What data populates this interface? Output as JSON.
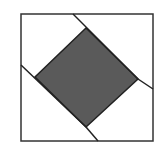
{
  "diagram": {
    "title": "",
    "outer_square": {
      "x": 21,
      "y": 14,
      "w": 132,
      "h": 127,
      "stroke": "#333333"
    },
    "inner_square": {
      "points": "86,28 138,79 86,127 35,77",
      "fill": "#5a5a5a",
      "stroke": "#222222"
    },
    "lines": [
      {
        "x1": 73,
        "y1": 14,
        "x2": 138,
        "y2": 79
      },
      {
        "x1": 138,
        "y1": 79,
        "x2": 153,
        "y2": 89
      },
      {
        "x1": 21,
        "y1": 65,
        "x2": 86,
        "y2": 127
      },
      {
        "x1": 86,
        "y1": 127,
        "x2": 98,
        "y2": 141
      }
    ]
  }
}
